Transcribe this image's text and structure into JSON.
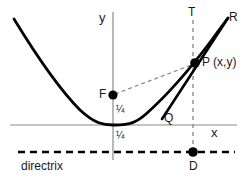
{
  "figure": {
    "background_color": "#ffffff",
    "width": 245,
    "height": 185
  },
  "colors": {
    "curve": "#000000",
    "axis": "#8a8a8a",
    "dashed_thin": "#8a8a8a",
    "directrix": "#000000",
    "point": "#000000",
    "text": "#1a1a1a"
  },
  "axes": {
    "x_label": "x",
    "y_label": "y",
    "origin": {
      "x": 113,
      "y": 125
    },
    "x_axis": {
      "x1": 10,
      "y1": 125,
      "x2": 237,
      "y2": 125
    },
    "y_axis": {
      "x1": 113,
      "y1": 12,
      "x2": 113,
      "y2": 160
    }
  },
  "labels": {
    "y": "y",
    "x": "x",
    "T": "T",
    "R": "R",
    "P": "P (x,y)",
    "F": "F",
    "Q": "Q",
    "D": "D",
    "directrix": "directrix",
    "focal_distance_above": "¼",
    "focal_distance_below": "¼"
  },
  "points": [
    {
      "name": "focus",
      "label": "F",
      "x": 113,
      "y": 95,
      "radius": 4.5
    },
    {
      "name": "point-p",
      "label": "P (x,y)",
      "x": 195,
      "y": 63,
      "radius": 4.5
    },
    {
      "name": "foot-d",
      "label": "D",
      "x": 193,
      "y": 152,
      "radius": 4.5
    }
  ],
  "curve": {
    "type": "parabola",
    "equation": "y = x^2",
    "vertex": {
      "x": 113,
      "y": 125
    },
    "path": "M 14,19 C 36,55 62,92 80,110 C 95,124 104,125 113,125 C 122,125 133,126 146,114 C 164,98 190,69 211,41 C 219,30 224,23 228,18"
  },
  "tangent_line": {
    "from_label": "Q",
    "to_label": "R",
    "through": "P (x,y)",
    "x1": 162,
    "y1": 119,
    "x2": 228,
    "y2": 18
  },
  "focal_radius": {
    "from": "F",
    "to": "P",
    "style": "dashed",
    "x1": 113,
    "y1": 95,
    "x2": 195,
    "y2": 63
  },
  "vertical_dashed": {
    "from": "T",
    "to": "D",
    "style": "dashed",
    "x": 193,
    "y1": 20,
    "y2": 153
  },
  "directrix_line": {
    "style": "dashed",
    "x1": 18,
    "y1": 152,
    "x2": 235,
    "y2": 152
  }
}
